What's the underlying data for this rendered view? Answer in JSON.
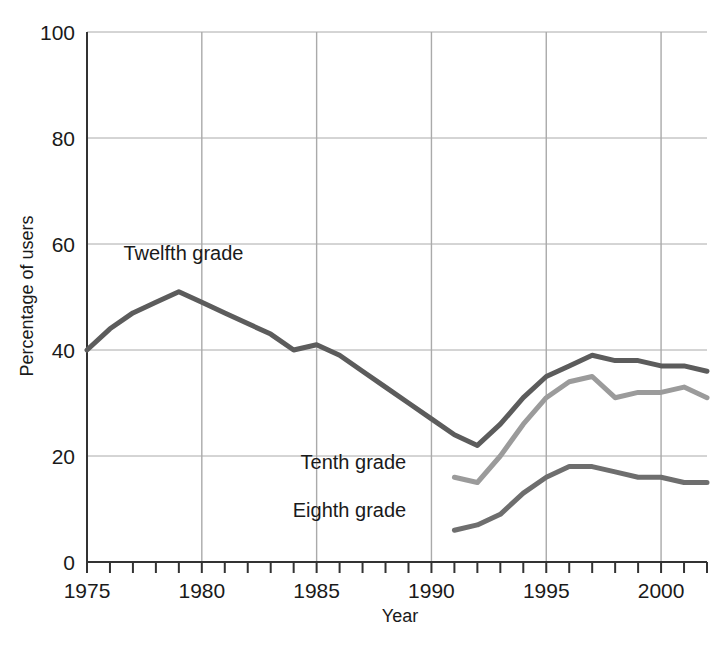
{
  "chart_data": {
    "type": "line",
    "title": "",
    "subtitle": "",
    "xlabel": "Year",
    "ylabel": "Percentage of users",
    "xlim": [
      1975,
      2002
    ],
    "ylim": [
      0,
      100
    ],
    "grid": true,
    "legend_position": "inline-annotations",
    "x_ticks_major": [
      1975,
      1980,
      1985,
      1990,
      1995,
      2000
    ],
    "x_tick_labels": [
      "1975",
      "1980",
      "1985",
      "1990",
      "1995",
      "2000"
    ],
    "y_ticks": [
      0,
      20,
      40,
      60,
      80,
      100
    ],
    "y_tick_labels": [
      "0",
      "20",
      "40",
      "60",
      "80",
      "100"
    ],
    "x_minor_tick_step": 1,
    "series": [
      {
        "name": "Twelfth grade",
        "color": "#5c5c5c",
        "label_x": 1979.2,
        "label_y": 57,
        "label_anchor": "middle",
        "x": [
          1975,
          1976,
          1977,
          1978,
          1979,
          1980,
          1981,
          1982,
          1983,
          1984,
          1985,
          1986,
          1987,
          1988,
          1989,
          1990,
          1991,
          1992,
          1993,
          1994,
          1995,
          1996,
          1997,
          1998,
          1999,
          2000,
          2001,
          2002
        ],
        "values": [
          40,
          44,
          47,
          49,
          51,
          49,
          47,
          45,
          43,
          40,
          41,
          39,
          36,
          33,
          30,
          27,
          24,
          22,
          26,
          31,
          35,
          37,
          39,
          38,
          38,
          37,
          37,
          36
        ]
      },
      {
        "name": "Tenth grade",
        "color": "#9b9b9b",
        "label_x": 1988.9,
        "label_y": 17.5,
        "label_anchor": "end",
        "x": [
          1991,
          1992,
          1993,
          1994,
          1995,
          1996,
          1997,
          1998,
          1999,
          2000,
          2001,
          2002
        ],
        "values": [
          16,
          15,
          20,
          26,
          31,
          34,
          35,
          31,
          32,
          32,
          33,
          31
        ]
      },
      {
        "name": "Eighth grade",
        "color": "#6e6e6e",
        "label_x": 1988.9,
        "label_y": 8.5,
        "label_anchor": "end",
        "x": [
          1991,
          1992,
          1993,
          1994,
          1995,
          1996,
          1997,
          1998,
          1999,
          2000,
          2001,
          2002
        ],
        "values": [
          6,
          7,
          9,
          13,
          16,
          18,
          18,
          17,
          16,
          16,
          15,
          15
        ]
      }
    ]
  },
  "axes": {
    "y_title": "Percentage of users",
    "x_title": "Year"
  },
  "colors": {
    "grid": "#aaaaaa",
    "axis": "#333333",
    "text": "#1a1a1a",
    "background": "#ffffff"
  }
}
